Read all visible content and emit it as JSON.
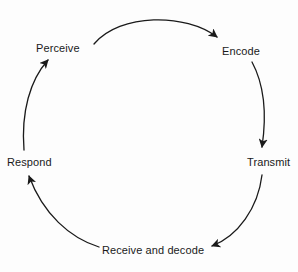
{
  "diagram": {
    "type": "communication-cycle",
    "shape": "circle",
    "direction": "clockwise",
    "stroke_color": "#1a1a1a",
    "text_color": "#1a1a1a",
    "background_color": "#fdfdfd",
    "nodes": [
      {
        "id": "perceive",
        "label": "Perceive",
        "position": "top-left"
      },
      {
        "id": "encode",
        "label": "Encode",
        "position": "top-right"
      },
      {
        "id": "transmit",
        "label": "Transmit",
        "position": "right"
      },
      {
        "id": "receive",
        "label": "Receive and decode",
        "position": "bottom"
      },
      {
        "id": "respond",
        "label": "Respond",
        "position": "left"
      }
    ],
    "edges": [
      {
        "from": "perceive",
        "to": "encode",
        "arrowhead": true
      },
      {
        "from": "encode",
        "to": "transmit",
        "arrowhead": true
      },
      {
        "from": "transmit",
        "to": "receive",
        "arrowhead": true
      },
      {
        "from": "receive",
        "to": "respond",
        "arrowhead": true
      },
      {
        "from": "respond",
        "to": "perceive",
        "arrowhead": true
      }
    ]
  }
}
